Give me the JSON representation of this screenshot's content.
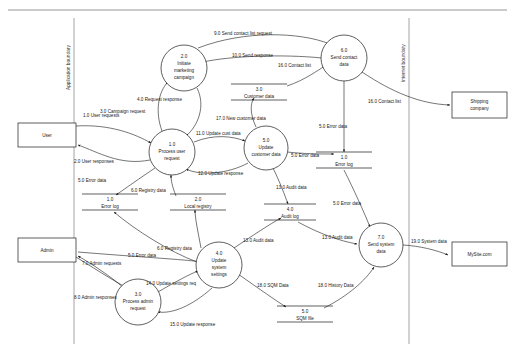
{
  "diagram": {
    "type": "data-flow-diagram",
    "title": "",
    "boundaries": [
      {
        "id": "application-boundary",
        "label": "Application boundary",
        "x": 74
      },
      {
        "id": "internet-boundary",
        "label": "Internet boundary",
        "x": 409
      }
    ],
    "external_entities": [
      {
        "id": "user",
        "label": "User",
        "x": 18,
        "y": 123,
        "w": 58,
        "h": 24
      },
      {
        "id": "admin",
        "label": "Admin",
        "x": 18,
        "y": 238,
        "w": 58,
        "h": 24
      },
      {
        "id": "shipping-company",
        "label": "Shipping company",
        "line1": "Shipping",
        "line2": "company",
        "x": 452,
        "y": 92,
        "w": 55,
        "h": 26
      },
      {
        "id": "mysite",
        "label": "MySite.com",
        "line1": "MySite.com",
        "line2": "",
        "x": 452,
        "y": 242,
        "w": 55,
        "h": 24
      }
    ],
    "processes": [
      {
        "id": "p2",
        "number": "2.0",
        "name": "Initiate marketing campaign",
        "lines": [
          "2.0",
          "Initiate",
          "marketing",
          "campaign"
        ],
        "cx": 184,
        "cy": 68,
        "r": 23
      },
      {
        "id": "p6",
        "number": "6.0",
        "name": "Send contact data",
        "lines": [
          "6.0",
          "Send contact",
          "data"
        ],
        "cx": 344,
        "cy": 58,
        "r": 23
      },
      {
        "id": "p1",
        "number": "1.0",
        "name": "Process user request",
        "lines": [
          "1.0",
          "Process user",
          "request"
        ],
        "cx": 172,
        "cy": 152,
        "r": 23
      },
      {
        "id": "p5",
        "number": "5.0",
        "name": "Update customer data",
        "lines": [
          "5.0",
          "Update",
          "customer data"
        ],
        "cx": 266,
        "cy": 148,
        "r": 22
      },
      {
        "id": "p4",
        "number": "4.0",
        "name": "Update system settings",
        "lines": [
          "4.0",
          "Update",
          "system",
          "settings"
        ],
        "cx": 219,
        "cy": 265,
        "r": 23
      },
      {
        "id": "p3",
        "number": "3.0",
        "name": "Process admin request",
        "lines": [
          "3.0",
          "Process admin",
          "request"
        ],
        "cx": 138,
        "cy": 302,
        "r": 23
      },
      {
        "id": "p7",
        "number": "7.0",
        "name": "Send system data",
        "lines": [
          "7.0",
          "Send system",
          "data"
        ],
        "cx": 381,
        "cy": 245,
        "r": 22
      }
    ],
    "data_stores": [
      {
        "id": "ds3",
        "number": "3.0",
        "name": "Customer data",
        "cx": 259,
        "cy": 92,
        "w": 56
      },
      {
        "id": "ds1-left",
        "number": "1.0",
        "name": "Error log",
        "cx": 110,
        "cy": 202,
        "w": 56
      },
      {
        "id": "ds2",
        "number": "2.0",
        "name": "Local registry",
        "cx": 198,
        "cy": 202,
        "w": 56
      },
      {
        "id": "ds1-right",
        "number": "1.0",
        "name": "Error log",
        "cx": 344,
        "cy": 160,
        "w": 56
      },
      {
        "id": "ds4",
        "number": "4.0",
        "name": "Audit log",
        "cx": 290,
        "cy": 212,
        "w": 52
      },
      {
        "id": "ds5",
        "number": "5.0",
        "name": "SQM file",
        "cx": 305,
        "cy": 314,
        "w": 56
      }
    ],
    "flows": [
      {
        "id": "f1",
        "label": "1.0 User requests",
        "x": 83,
        "y": 117
      },
      {
        "id": "f2",
        "label": "2.0 User responses",
        "x": 74,
        "y": 163
      },
      {
        "id": "f3",
        "label": "3.0 Campaign request",
        "x": 100,
        "y": 113
      },
      {
        "id": "f4",
        "label": "4.0 Request response",
        "x": 137,
        "y": 101
      },
      {
        "id": "f5a",
        "label": "5.0 Error data",
        "x": 78,
        "y": 182
      },
      {
        "id": "f6a",
        "label": "6.0 Registry data",
        "x": 131,
        "y": 192
      },
      {
        "id": "f11",
        "label": "11.0 Update cust data",
        "x": 196,
        "y": 135
      },
      {
        "id": "f12",
        "label": "12.0 Update response",
        "x": 198,
        "y": 175
      },
      {
        "id": "f17",
        "label": "17.0 New customer data",
        "x": 216,
        "y": 120
      },
      {
        "id": "f9",
        "label": "9.0 Send contact list request",
        "x": 214,
        "y": 35
      },
      {
        "id": "f10",
        "label": "10.0 Send response",
        "x": 232,
        "y": 57
      },
      {
        "id": "f16a",
        "label": "16.0 Contact list",
        "x": 278,
        "y": 67
      },
      {
        "id": "f16b",
        "label": "16.0 Contact list",
        "x": 368,
        "y": 103
      },
      {
        "id": "f5b",
        "label": "5.0 Error data",
        "x": 319,
        "y": 128
      },
      {
        "id": "f5c",
        "label": "5.0 Error data",
        "x": 291,
        "y": 157
      },
      {
        "id": "f13a",
        "label": "13.0 Audit data",
        "x": 276,
        "y": 189
      },
      {
        "id": "f13b",
        "label": "13.0 Audit data",
        "x": 243,
        "y": 242
      },
      {
        "id": "f13c",
        "label": "13.0 Audit data",
        "x": 322,
        "y": 239
      },
      {
        "id": "f5d",
        "label": "5.0 Error data",
        "x": 333,
        "y": 205
      },
      {
        "id": "f5e",
        "label": "5.0 Error data",
        "x": 128,
        "y": 257
      },
      {
        "id": "f6b",
        "label": "6.0 Registry data",
        "x": 157,
        "y": 250
      },
      {
        "id": "f7",
        "label": "7.0 Admin requests",
        "x": 82,
        "y": 265
      },
      {
        "id": "f8",
        "label": "8.0 Admin responses",
        "x": 74,
        "y": 299
      },
      {
        "id": "f14",
        "label": "14.0 Update settings req",
        "x": 146,
        "y": 285
      },
      {
        "id": "f15",
        "label": "15.0 Update response",
        "x": 170,
        "y": 326
      },
      {
        "id": "f18a",
        "label": "18.0 SQM Data",
        "x": 257,
        "y": 287
      },
      {
        "id": "f18b",
        "label": "18.0 History Data",
        "x": 318,
        "y": 287
      },
      {
        "id": "f19",
        "label": "19.0 System data",
        "x": 411,
        "y": 243
      }
    ]
  }
}
